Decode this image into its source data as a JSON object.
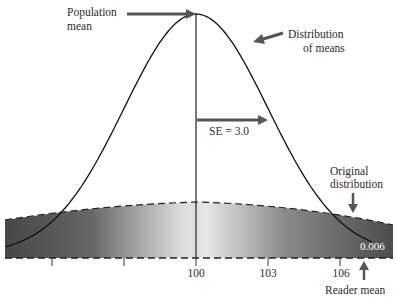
{
  "chart_data": {
    "type": "area",
    "title": "",
    "xlabel": "",
    "ylabel": "",
    "x_ticks": [
      94,
      97,
      100,
      103,
      106
    ],
    "x_tick_labels": [
      "",
      "",
      "100",
      "103",
      "106"
    ],
    "xlim": [
      92,
      108
    ],
    "series": [
      {
        "name": "Distribution of means",
        "kind": "normal_curve",
        "mean": 100,
        "sd": 3.0
      },
      {
        "name": "Original distribution",
        "kind": "wide_flat_band",
        "mean": 100
      }
    ],
    "annotations": [
      {
        "text": "Population mean",
        "target_x": 100,
        "kind": "arrow-right"
      },
      {
        "text": "Distribution of means",
        "kind": "arrow-left"
      },
      {
        "text": "SE = 3.0",
        "from_x": 100,
        "to_x": 103,
        "kind": "arrow-right"
      },
      {
        "text": "Original distribution",
        "kind": "arrow-down"
      },
      {
        "text": "0.006",
        "x": 107,
        "kind": "tail-probability"
      },
      {
        "text": "Reader mean",
        "x": 107,
        "kind": "arrow-up"
      }
    ],
    "grid": false,
    "legend": "none"
  },
  "labels": {
    "population_mean_line1": "Population",
    "population_mean_line2": "mean",
    "dist_means_line1": "Distribution",
    "dist_means_line2": "of means",
    "se": "SE = 3.0",
    "original_line1": "Original",
    "original_line2": "distribution",
    "tail_value": "0.006",
    "reader_mean": "Reader mean",
    "tick_100": "100",
    "tick_103": "103",
    "tick_106": "106"
  },
  "colors": {
    "band_dark": "#4a4a4a",
    "band_light": "#f2f2f2",
    "curve": "#111111",
    "arrow": "#555555"
  }
}
